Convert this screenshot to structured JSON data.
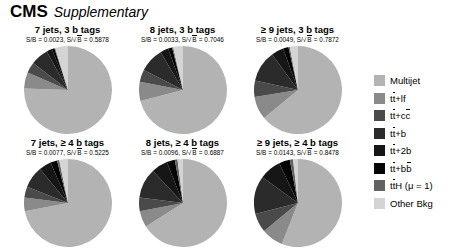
{
  "header": {
    "experiment": "CMS",
    "qualifier": "Supplementary"
  },
  "legend": {
    "position": "right",
    "items": [
      {
        "label": "Multijet",
        "color": "#b3b3b3"
      },
      {
        "label": "tt̄+lf",
        "html": "t<span class=\"ovl\">t</span>+lf",
        "color": "#8a8a8a"
      },
      {
        "label": "tt+cc",
        "html": "t<span class=\"ovl\">t</span>+c<span class=\"ovl\">c</span>",
        "color": "#4a4a4a"
      },
      {
        "label": "tt+b",
        "html": "t<span class=\"ovl\">t</span>+b",
        "color": "#2b2b2b"
      },
      {
        "label": "tt+2b",
        "html": "t<span class=\"ovl\">t</span>+2b",
        "color": "#161616"
      },
      {
        "label": "tt+bb",
        "html": "t<span class=\"ovl\">t</span>+b<span class=\"ovl\">b</span>",
        "color": "#050505"
      },
      {
        "label": "ttH (mu = 1)",
        "html": "t<span class=\"ovl\">t</span>H (μ = 1)",
        "color": "#626262"
      },
      {
        "label": "Other Bkg",
        "color": "#d4d4d4"
      }
    ]
  },
  "chart_data": {
    "type": "pie",
    "title": "CMS Supplementary",
    "grid": false,
    "legend_position": "right",
    "categories": [
      "Multijet",
      "tt+lf",
      "tt+cc",
      "tt+b",
      "tt+2b",
      "tt+bb",
      "ttH (mu = 1)",
      "Other Bkg"
    ],
    "colors": [
      "#b3b3b3",
      "#8a8a8a",
      "#4a4a4a",
      "#2b2b2b",
      "#161616",
      "#050505",
      "#626262",
      "#d4d4d4"
    ],
    "panels": [
      {
        "id": "p1",
        "title": "7 jets, 3 b tags",
        "sb": "S/B = 0.0023",
        "ssqrtb": "S/√B = 0.5878",
        "sb_value": 0.0023,
        "ssqrtb_value": 0.5878,
        "values": [
          75.5,
          6.0,
          4.0,
          6.5,
          2.0,
          1.0,
          0.3,
          4.7
        ]
      },
      {
        "id": "p2",
        "title": "8 jets, 3 b tags",
        "sb": "S/B = 0.0033",
        "ssqrtb": "S/√B = 0.7046",
        "sb_value": 0.0033,
        "ssqrtb_value": 0.7046,
        "values": [
          71.0,
          7.0,
          4.5,
          9.0,
          3.0,
          1.5,
          0.4,
          3.6
        ]
      },
      {
        "id": "p3",
        "title": "≥ 9 jets, 3 b tags",
        "sb": "S/B = 0.0049",
        "ssqrtb": "S/√B = 0.7872",
        "sb_value": 0.0049,
        "ssqrtb_value": 0.7872,
        "values": [
          64.0,
          8.5,
          6.0,
          11.5,
          4.5,
          2.0,
          0.5,
          3.0
        ]
      },
      {
        "id": "p4",
        "title": "7 jets, ≥ 4 b tags",
        "sb": "S/B = 0.0077",
        "ssqrtb": "S/√B = 0.5225",
        "sb_value": 0.0077,
        "ssqrtb_value": 0.5225,
        "values": [
          72.0,
          5.0,
          4.0,
          8.0,
          4.5,
          2.5,
          0.8,
          3.2
        ]
      },
      {
        "id": "p5",
        "title": "8 jets, ≥ 4 b tags",
        "sb": "S/B = 0.0096",
        "ssqrtb": "S/√B = 0.6887",
        "sb_value": 0.0096,
        "ssqrtb_value": 0.6887,
        "values": [
          66.0,
          6.0,
          5.0,
          11.0,
          6.0,
          3.0,
          1.0,
          2.0
        ]
      },
      {
        "id": "p6",
        "title": "≥ 9 jets, ≥ 4 b tags",
        "sb": "S/B = 0.0143",
        "ssqrtb": "S/√B = 0.8478",
        "sb_value": 0.0143,
        "ssqrtb_value": 0.8478,
        "values": [
          56.0,
          8.0,
          7.0,
          14.0,
          8.0,
          4.0,
          1.2,
          1.8
        ]
      }
    ]
  }
}
